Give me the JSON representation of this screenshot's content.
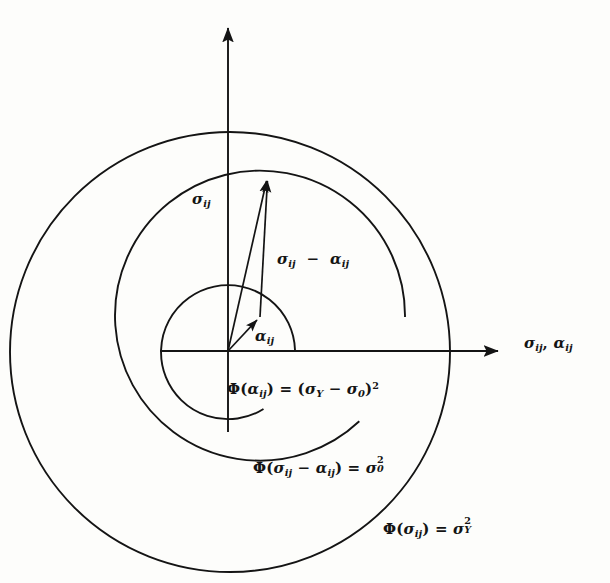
{
  "figure": {
    "domain": "mechanics-yield-surface-diagram",
    "background_color": "#fdfdfb",
    "ink_color": "#141414",
    "axes": {
      "origin": [
        228,
        351
      ],
      "x_axis_label": "σij, αij",
      "x_axis_from": [
        160,
        351
      ],
      "x_axis_to": [
        505,
        351
      ],
      "y_axis_from": [
        228,
        430
      ],
      "y_axis_to": [
        228,
        22
      ]
    },
    "vectors": [
      {
        "name": "stress-vector",
        "label": "σij",
        "from": [
          228,
          351
        ],
        "to": [
          268,
          175
        ],
        "label_pos": [
          192,
          192
        ]
      },
      {
        "name": "relative-stress-vector",
        "label": "σij − αij",
        "from": [
          260,
          317
        ],
        "to": [
          268,
          175
        ],
        "label_pos": [
          277,
          252
        ]
      },
      {
        "name": "backstress-vector",
        "label": "αij",
        "from": [
          228,
          351
        ],
        "to": [
          260,
          317
        ],
        "label_pos": [
          255,
          329
        ]
      }
    ],
    "circles": [
      {
        "name": "backstress-surface",
        "equation": "Φ(αij) = (σY − σ0)²",
        "center": [
          228,
          350
        ],
        "radius": 67,
        "label_pos": [
          227,
          381
        ]
      },
      {
        "name": "yield-surface-translated",
        "equation": "Φ(σij − αij) = σ0²",
        "center": [
          260,
          317
        ],
        "radius": 145,
        "label_pos": [
          253,
          458
        ]
      },
      {
        "name": "bounding-surface",
        "equation": "Φ(σij) = σY²",
        "center": [
          230,
          352
        ],
        "radius": 220,
        "label_pos": [
          383,
          519
        ]
      }
    ],
    "labels": {
      "sigma_vector": "σij",
      "difference_vector": "σij − αij",
      "alpha_vector": "αij",
      "axis": "σij, αij",
      "phi_alpha": "Φ(αij) = (σY − σ0)²",
      "phi_difference": "Φ(σij − αij) = σ0²",
      "phi_sigma": "Φ(σij) = σY²"
    },
    "symbols": {
      "sigma": "σ",
      "alpha": "α",
      "phi": "Φ",
      "minus": "−",
      "equals": "=",
      "comma": ",",
      "sub_ij": "ij",
      "sub_Y": "Y",
      "sub_0": "0",
      "sup_2": "2",
      "paren_open": "(",
      "paren_close": ")"
    }
  }
}
